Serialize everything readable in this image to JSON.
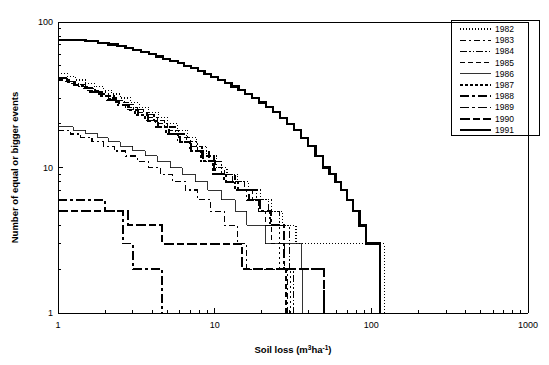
{
  "chart_data": {
    "type": "line",
    "title": "",
    "xlabel": "Soil loss (m3ha-1)",
    "ylabel": "Number of equal or bigger events",
    "xscale": "log",
    "yscale": "log",
    "xlim": [
      1,
      1000
    ],
    "ylim": [
      1,
      100
    ],
    "xticklabels": [
      "1",
      "10",
      "100",
      "1000"
    ],
    "yticklabels": [
      "1",
      "10",
      "100"
    ],
    "grid": false,
    "legend_position": "top-right",
    "note": "Exceedance (survival) step curves of soil-loss events per year 1982-1991; y = number of equal or bigger events, x = soil loss.",
    "series": [
      {
        "name": "1982",
        "dash": "1,2",
        "width": 1.2,
        "points": [
          [
            1.0,
            44
          ],
          [
            1.15,
            42
          ],
          [
            1.3,
            40
          ],
          [
            1.5,
            38
          ],
          [
            1.7,
            36
          ],
          [
            1.95,
            34
          ],
          [
            2.2,
            32
          ],
          [
            2.5,
            30
          ],
          [
            2.9,
            28
          ],
          [
            3.3,
            26
          ],
          [
            3.8,
            24
          ],
          [
            4.4,
            22
          ],
          [
            5.0,
            20
          ],
          [
            5.8,
            18
          ],
          [
            6.7,
            16
          ],
          [
            7.7,
            14
          ],
          [
            8.9,
            12
          ],
          [
            10.3,
            10
          ],
          [
            12.0,
            9
          ],
          [
            14.0,
            8
          ],
          [
            16.5,
            7
          ],
          [
            19.5,
            6
          ],
          [
            23.0,
            5
          ],
          [
            27.0,
            4
          ],
          [
            33.0,
            3
          ],
          [
            121.0,
            3
          ],
          [
            121.0,
            2
          ],
          [
            121.0,
            1
          ]
        ]
      },
      {
        "name": "1983",
        "dash": "6,3,2,3",
        "width": 1.2,
        "points": [
          [
            1.0,
            18
          ],
          [
            1.2,
            17
          ],
          [
            1.4,
            16
          ],
          [
            1.65,
            15
          ],
          [
            1.95,
            14
          ],
          [
            2.3,
            13
          ],
          [
            2.7,
            12
          ],
          [
            3.2,
            11
          ],
          [
            3.8,
            10
          ],
          [
            4.5,
            9
          ],
          [
            5.4,
            8
          ],
          [
            6.5,
            7
          ],
          [
            7.8,
            6
          ],
          [
            9.4,
            5
          ],
          [
            11.5,
            4
          ],
          [
            14.0,
            3
          ],
          [
            16.0,
            3
          ],
          [
            16.0,
            2
          ],
          [
            29.0,
            2
          ],
          [
            29.0,
            1
          ]
        ]
      },
      {
        "name": "1984",
        "dash": "7,2,1.5,2,1.5,2",
        "width": 1.2,
        "points": [
          [
            1.0,
            41
          ],
          [
            1.15,
            39
          ],
          [
            1.3,
            37
          ],
          [
            1.5,
            35
          ],
          [
            1.72,
            33
          ],
          [
            2.0,
            31
          ],
          [
            2.3,
            29
          ],
          [
            2.65,
            27
          ],
          [
            3.05,
            25
          ],
          [
            3.5,
            23
          ],
          [
            4.1,
            21
          ],
          [
            4.8,
            19
          ],
          [
            5.6,
            17
          ],
          [
            6.6,
            15
          ],
          [
            7.8,
            13
          ],
          [
            9.2,
            11
          ],
          [
            11.0,
            9
          ],
          [
            13.0,
            8
          ],
          [
            15.5,
            7
          ],
          [
            18.5,
            6
          ],
          [
            22.0,
            5
          ],
          [
            26.0,
            4
          ],
          [
            30.0,
            3
          ],
          [
            30.0,
            2
          ],
          [
            32.0,
            2
          ],
          [
            32.0,
            1
          ]
        ]
      },
      {
        "name": "1985",
        "dash": "5,3",
        "width": 1.2,
        "points": [
          [
            1.0,
            40
          ],
          [
            1.18,
            38
          ],
          [
            1.35,
            36
          ],
          [
            1.55,
            34
          ],
          [
            1.8,
            32
          ],
          [
            2.1,
            30
          ],
          [
            2.4,
            28
          ],
          [
            2.8,
            26
          ],
          [
            3.2,
            24
          ],
          [
            3.7,
            22
          ],
          [
            4.3,
            20
          ],
          [
            5.0,
            18
          ],
          [
            5.9,
            16
          ],
          [
            7.0,
            14
          ],
          [
            8.3,
            12
          ],
          [
            9.9,
            10
          ],
          [
            11.5,
            9
          ],
          [
            13.5,
            8
          ],
          [
            15.5,
            7
          ],
          [
            17.5,
            6
          ],
          [
            19.0,
            5
          ],
          [
            21.0,
            4
          ],
          [
            23.0,
            3
          ],
          [
            28.0,
            3
          ],
          [
            28.0,
            2
          ],
          [
            28.5,
            2
          ],
          [
            28.5,
            1
          ]
        ]
      },
      {
        "name": "1986",
        "dash": "none",
        "width": 0.8,
        "points": [
          [
            1.0,
            19
          ],
          [
            1.25,
            18
          ],
          [
            1.5,
            17
          ],
          [
            1.8,
            16
          ],
          [
            2.1,
            15
          ],
          [
            2.5,
            14
          ],
          [
            3.0,
            13
          ],
          [
            3.6,
            12
          ],
          [
            4.3,
            11
          ],
          [
            5.2,
            10
          ],
          [
            6.2,
            9
          ],
          [
            7.5,
            8
          ],
          [
            9.0,
            7
          ],
          [
            11.0,
            6
          ],
          [
            13.5,
            5
          ],
          [
            16.0,
            4
          ],
          [
            21.0,
            4
          ],
          [
            21.0,
            3
          ],
          [
            36.0,
            3
          ],
          [
            36.0,
            2
          ],
          [
            36.5,
            2
          ],
          [
            36.5,
            1
          ]
        ]
      },
      {
        "name": "1987",
        "dash": "2.5,2.5",
        "width": 1.6,
        "points": [
          [
            1.0,
            41
          ],
          [
            1.12,
            39
          ],
          [
            1.26,
            37
          ],
          [
            1.42,
            35
          ],
          [
            1.6,
            33
          ],
          [
            1.82,
            31
          ],
          [
            2.05,
            29
          ],
          [
            2.35,
            27
          ],
          [
            2.7,
            25
          ],
          [
            3.1,
            23
          ],
          [
            3.6,
            21
          ],
          [
            4.2,
            19
          ],
          [
            4.9,
            17
          ],
          [
            5.8,
            15
          ],
          [
            6.9,
            13
          ],
          [
            8.2,
            11
          ],
          [
            9.8,
            9
          ],
          [
            11.5,
            8
          ],
          [
            13.5,
            7
          ],
          [
            16.0,
            6
          ],
          [
            19.0,
            5
          ],
          [
            22.5,
            4
          ],
          [
            26.0,
            3
          ],
          [
            26.0,
            2
          ],
          [
            30.5,
            2
          ],
          [
            30.5,
            1
          ]
        ]
      },
      {
        "name": "1988",
        "dash": "9,3,3,3",
        "width": 2.0,
        "points": [
          [
            1.0,
            41
          ],
          [
            1.13,
            39
          ],
          [
            1.28,
            37
          ],
          [
            1.45,
            35
          ],
          [
            1.65,
            33
          ],
          [
            1.88,
            31
          ],
          [
            2.15,
            29
          ],
          [
            2.45,
            27
          ],
          [
            2.82,
            25
          ],
          [
            3.25,
            23
          ],
          [
            3.75,
            21
          ],
          [
            4.35,
            19
          ],
          [
            5.1,
            17
          ],
          [
            6.0,
            15
          ],
          [
            7.1,
            13
          ],
          [
            8.4,
            11
          ],
          [
            10.0,
            9
          ],
          [
            11.8,
            8
          ],
          [
            14.0,
            7
          ],
          [
            16.5,
            6
          ],
          [
            19.5,
            5
          ],
          [
            23.0,
            4
          ],
          [
            27.5,
            3
          ],
          [
            27.5,
            2
          ],
          [
            50.0,
            2
          ],
          [
            50.0,
            1
          ]
        ]
      },
      {
        "name": "1989",
        "dash": "9,3,3,3",
        "width": 1.8,
        "points": [
          [
            1.0,
            6
          ],
          [
            2.0,
            6
          ],
          [
            2.0,
            5
          ],
          [
            2.6,
            5
          ],
          [
            2.6,
            3
          ],
          [
            3.0,
            3
          ],
          [
            3.0,
            2
          ],
          [
            4.6,
            2
          ],
          [
            4.6,
            1
          ]
        ]
      },
      {
        "name": "1990",
        "dash": "10,3,7,3",
        "width": 2.0,
        "points": [
          [
            1.0,
            5
          ],
          [
            2.8,
            5
          ],
          [
            2.8,
            4
          ],
          [
            4.6,
            4
          ],
          [
            4.6,
            3
          ],
          [
            15.0,
            3
          ],
          [
            15.0,
            2
          ],
          [
            50.0,
            2
          ],
          [
            50.0,
            1
          ]
        ]
      },
      {
        "name": "1991",
        "dash": "none",
        "width": 2.2,
        "points": [
          [
            1.0,
            75
          ],
          [
            1.5,
            74
          ],
          [
            1.8,
            72
          ],
          [
            2.1,
            70
          ],
          [
            2.4,
            68
          ],
          [
            2.7,
            66
          ],
          [
            3.0,
            64
          ],
          [
            3.4,
            62
          ],
          [
            3.8,
            60
          ],
          [
            4.2,
            58
          ],
          [
            4.7,
            56
          ],
          [
            5.2,
            54
          ],
          [
            5.8,
            52
          ],
          [
            6.4,
            50
          ],
          [
            7.1,
            48
          ],
          [
            7.8,
            46
          ],
          [
            8.6,
            44
          ],
          [
            9.5,
            42
          ],
          [
            10.5,
            40
          ],
          [
            11.6,
            38
          ],
          [
            12.8,
            36
          ],
          [
            14.2,
            34
          ],
          [
            15.7,
            32
          ],
          [
            17.3,
            30
          ],
          [
            19.1,
            28
          ],
          [
            21.2,
            26
          ],
          [
            23.5,
            24
          ],
          [
            26.0,
            22
          ],
          [
            28.8,
            20
          ],
          [
            32.0,
            18
          ],
          [
            35.5,
            16
          ],
          [
            39.5,
            14
          ],
          [
            44.0,
            12
          ],
          [
            49.0,
            10
          ],
          [
            54.0,
            9
          ],
          [
            59.0,
            8
          ],
          [
            64.0,
            7
          ],
          [
            70.0,
            6
          ],
          [
            76.0,
            5
          ],
          [
            84.0,
            4
          ],
          [
            92.0,
            3
          ],
          [
            114.0,
            3
          ],
          [
            114.0,
            2
          ],
          [
            114.0,
            1
          ]
        ]
      }
    ]
  },
  "legend": {
    "entries": [
      {
        "label": "1982"
      },
      {
        "label": "1983"
      },
      {
        "label": "1984"
      },
      {
        "label": "1985"
      },
      {
        "label": "1986"
      },
      {
        "label": "1987"
      },
      {
        "label": "1988"
      },
      {
        "label": "1989"
      },
      {
        "label": "1990"
      },
      {
        "label": "1991"
      }
    ]
  },
  "axes": {
    "x_title_main": "Soil loss (m",
    "x_title_sup1": "3",
    "x_title_mid": "ha",
    "x_title_sup2": "-1",
    "x_title_end": ")",
    "y_title": "Number of equal or bigger events"
  },
  "colors": {
    "foreground": "#000000",
    "background": "#ffffff"
  }
}
